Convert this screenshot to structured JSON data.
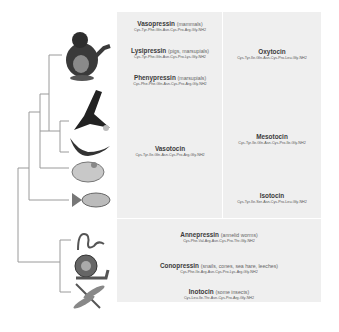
{
  "figure": {
    "left_column": [
      {
        "name": "Vasopressin",
        "note": "(mammals)",
        "sequence": "Cys-Tyr-Phe-Gln-Asn-Cys-Pro-Arg-Gly-NH2"
      },
      {
        "name": "Lysipressin",
        "note": "(pigs, marsupials)",
        "sequence": "Cys-Tyr-Phe-Gln-Asn-Cys-Pro-Lys-Gly-NH2"
      },
      {
        "name": "Phenypressin",
        "note": "(marsupials)",
        "sequence": "Cys-Phe-Phe-Gln-Asn-Cys-Pro-Arg-Gly-NH2"
      },
      {
        "name": "Vasotocin",
        "note": "",
        "sequence": "Cys-Tyr-Ile-Gln-Asn-Cys-Pro-Arg-Gly-NH2"
      }
    ],
    "right_column": [
      {
        "name": "Oxytocin",
        "note": "",
        "sequence": "Cys-Tyr-Ile-Gln-Asn-Cys-Pro-Leu-Gly-NH2"
      },
      {
        "name": "Mesotocin",
        "note": "",
        "sequence": "Cys-Tyr-Ile-Gln-Asn-Cys-Pro-Ile-Gly-NH2"
      },
      {
        "name": "Isotocin",
        "note": "",
        "sequence": "Cys-Tyr-Ile-Ser-Asn-Cys-Pro-Leu-Gly-NH2"
      }
    ],
    "bottom": [
      {
        "name": "Annepressin",
        "note": "(annelid worms)",
        "sequence": "Cys-Phe-Val-Arg-Asn-Cys-Pro-Thr-Gly-NH2"
      },
      {
        "name": "Conopressin",
        "note": "(snails, cones, sea hare, leeches)",
        "sequence": "Cys-Phe-Ile-Arg-Asn-Cys-Pro-Lys-Arg-Gly-NH2"
      },
      {
        "name": "Inotocin",
        "note": "(some insects)",
        "sequence": "Cys-Leu-Ile-Thr-Asn-Cys-Pro-Arg-Gly-NH2"
      }
    ],
    "animals": [
      "gorilla",
      "eagle",
      "salamander",
      "frog",
      "fish",
      "worm",
      "snail",
      "dragonfly"
    ]
  }
}
